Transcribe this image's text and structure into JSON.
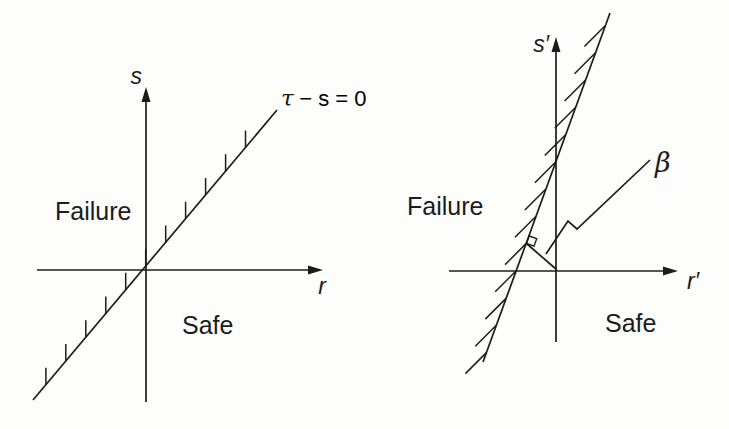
{
  "colors": {
    "ink": "#1c1c1c",
    "background": "#fdfdfc"
  },
  "left_diagram": {
    "y_axis_label": "s",
    "x_axis_label": "r",
    "limit_line_label_tau": "τ",
    "limit_line_label_rest": " − s = 0",
    "failure_label": "Failure",
    "safe_label": "Safe"
  },
  "right_diagram": {
    "y_axis_label": "s′",
    "x_axis_label": "r′",
    "beta_label": "β",
    "failure_label": "Failure",
    "safe_label": "Safe"
  }
}
